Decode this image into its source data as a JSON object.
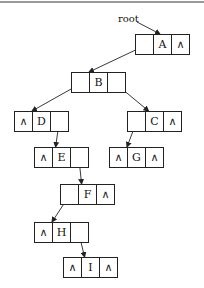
{
  "diagram": {
    "type": "binary-tree-linked-representation",
    "root_label": "root",
    "null_symbol": "∧",
    "cell_width": 18,
    "cell_height": 20,
    "nodes": [
      {
        "id": "A",
        "x": 135,
        "y": 34,
        "left": "B",
        "right": null
      },
      {
        "id": "B",
        "x": 71,
        "y": 72,
        "left": "D",
        "right": "C"
      },
      {
        "id": "D",
        "x": 14,
        "y": 111,
        "left": null,
        "right": "E"
      },
      {
        "id": "C",
        "x": 127,
        "y": 111,
        "left": "G",
        "right": null
      },
      {
        "id": "E",
        "x": 34,
        "y": 147,
        "left": null,
        "right": "F"
      },
      {
        "id": "G",
        "x": 109,
        "y": 147,
        "left": null,
        "right": null
      },
      {
        "id": "F",
        "x": 60,
        "y": 184,
        "left": "H",
        "right": null
      },
      {
        "id": "H",
        "x": 34,
        "y": 222,
        "left": null,
        "right": "I"
      },
      {
        "id": "I",
        "x": 63,
        "y": 257,
        "left": null,
        "right": null
      }
    ]
  }
}
